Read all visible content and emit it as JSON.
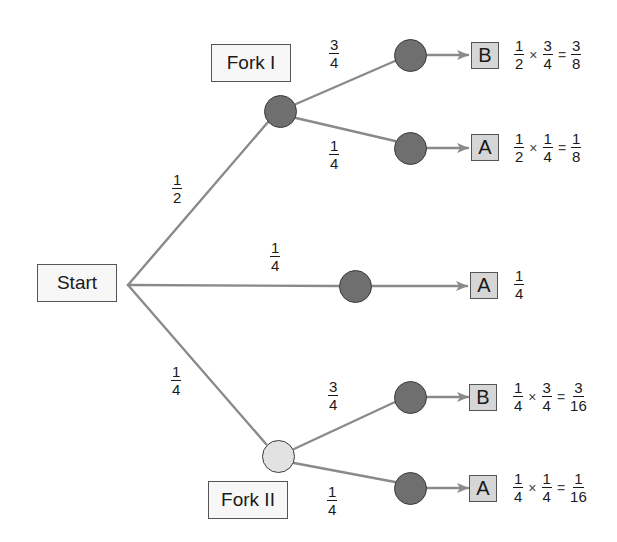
{
  "diagram": {
    "type": "probability-tree",
    "colors": {
      "edge": "#8a8a8a",
      "node_dark": "#6f6f6f",
      "node_light": "#e2e2e2",
      "outcome_box": "#d6d6d6",
      "label_box": "#f7f7f7"
    },
    "start": {
      "label": "Start"
    },
    "forks": [
      {
        "id": "fork1",
        "label": "Fork I"
      },
      {
        "id": "fork2",
        "label": "Fork II"
      }
    ],
    "root_branches": [
      {
        "to": "Fork I",
        "prob": {
          "num": "1",
          "den": "2"
        }
      },
      {
        "to": "middle",
        "prob": {
          "num": "1",
          "den": "4"
        }
      },
      {
        "to": "Fork II",
        "prob": {
          "num": "1",
          "den": "4"
        }
      }
    ],
    "leaf_branches": [
      {
        "from": "Fork I",
        "prob": {
          "num": "3",
          "den": "4"
        }
      },
      {
        "from": "Fork I",
        "prob": {
          "num": "1",
          "den": "4"
        }
      },
      {
        "from": "Fork II",
        "prob": {
          "num": "3",
          "den": "4"
        }
      },
      {
        "from": "Fork II",
        "prob": {
          "num": "1",
          "den": "4"
        }
      }
    ],
    "outcomes": [
      {
        "label": "B",
        "calc": {
          "a": {
            "num": "1",
            "den": "2"
          },
          "b": {
            "num": "3",
            "den": "4"
          },
          "r": {
            "num": "3",
            "den": "8"
          }
        }
      },
      {
        "label": "A",
        "calc": {
          "a": {
            "num": "1",
            "den": "2"
          },
          "b": {
            "num": "1",
            "den": "4"
          },
          "r": {
            "num": "1",
            "den": "8"
          }
        }
      },
      {
        "label": "A",
        "calc": {
          "r": {
            "num": "1",
            "den": "4"
          }
        }
      },
      {
        "label": "B",
        "calc": {
          "a": {
            "num": "1",
            "den": "4"
          },
          "b": {
            "num": "3",
            "den": "4"
          },
          "r": {
            "num": "3",
            "den": "16"
          }
        }
      },
      {
        "label": "A",
        "calc": {
          "a": {
            "num": "1",
            "den": "4"
          },
          "b": {
            "num": "1",
            "den": "4"
          },
          "r": {
            "num": "1",
            "den": "16"
          }
        }
      }
    ],
    "symbols": {
      "times": "×",
      "equals": "="
    }
  }
}
